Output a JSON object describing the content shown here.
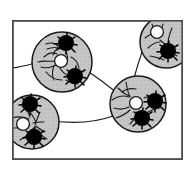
{
  "figure": {
    "panel_label": "a",
    "caption_text": "",
    "frame": {
      "x": 12,
      "y": 20,
      "width": 171,
      "height": 140,
      "stroke_color": "#4d4d4d",
      "fill_color": "#ffffff",
      "stroke_width": 1.6
    },
    "style": {
      "cluster_fill": "#c9c9c9",
      "cluster_stroke": "#1a1a1a",
      "cell_fill": "#000000",
      "nucleus_fill": "#ffffff",
      "nucleus_stroke": "#1a1a1a",
      "fiber_color": "#1a1a1a",
      "process_color": "#1a1a1a",
      "background": "#ffffff"
    },
    "legend_items": [
      {
        "name": "cluster",
        "label": "stippled grey cluster"
      },
      {
        "name": "dark-cell",
        "label": "dark stellate cell"
      },
      {
        "name": "pale-cell",
        "label": "pale round cell"
      },
      {
        "name": "fiber",
        "label": "connecting fiber"
      }
    ],
    "clusters": [
      {
        "id": "cluster-top-left",
        "cx": 62,
        "cy": 62,
        "r": 30,
        "dark_cells": [
          {
            "cx": 66,
            "cy": 43,
            "r": 8.0
          },
          {
            "cx": 75,
            "cy": 76,
            "r": 8.0
          }
        ],
        "pale_cells": [
          {
            "cx": 61,
            "cy": 61,
            "r": 6.4
          }
        ]
      },
      {
        "id": "cluster-top-right",
        "cx": 166,
        "cy": 42,
        "r": 26,
        "dark_cells": [
          {
            "cx": 168,
            "cy": 51,
            "r": 8.0
          }
        ],
        "pale_cells": [
          {
            "cx": 157,
            "cy": 32,
            "r": 6.4
          }
        ]
      },
      {
        "id": "cluster-center-right",
        "cx": 138,
        "cy": 104,
        "r": 28,
        "dark_cells": [
          {
            "cx": 155,
            "cy": 101,
            "r": 8.0
          },
          {
            "cx": 142,
            "cy": 118,
            "r": 8.0
          }
        ],
        "pale_cells": [
          {
            "cx": 136,
            "cy": 103,
            "r": 6.4
          }
        ]
      },
      {
        "id": "cluster-bottom-left",
        "cx": 32,
        "cy": 122,
        "r": 27,
        "dark_cells": [
          {
            "cx": 30,
            "cy": 104,
            "r": 8.0
          },
          {
            "cx": 34,
            "cy": 137,
            "r": 8.0
          }
        ],
        "pale_cells": [
          {
            "cx": 23,
            "cy": 124,
            "r": 6.4
          }
        ]
      }
    ],
    "fibers": [
      {
        "id": "fiber-left-edge-to-top-left",
        "d": "M 12 68 C 24 67 34 63 42 61"
      },
      {
        "id": "fiber-top-left-to-center",
        "d": "M 86 70 C 98 78 108 84 118 92"
      },
      {
        "id": "fiber-center-to-top-right",
        "d": "M 135 80 C 140 62 146 44 152 30 C 156 24 158 21 159 20"
      },
      {
        "id": "fiber-bottom-left-to-center",
        "d": "M 52 120 C 72 124 94 123 112 117"
      },
      {
        "id": "fiber-bottom-left-stub",
        "d": "M 45 120 L 60 120"
      }
    ],
    "counts": {
      "clusters": 4,
      "dark_cells": 7,
      "pale_cells": 4,
      "fibers": 4
    }
  }
}
